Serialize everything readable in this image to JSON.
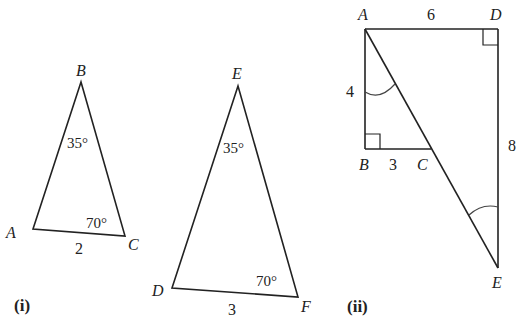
{
  "figures": [
    {
      "caption": "(i)",
      "triangles": [
        {
          "vertices": {
            "A": "A",
            "B": "B",
            "C": "C"
          },
          "angle_B": "35°",
          "angle_C": "70°",
          "side_AC": "2"
        },
        {
          "vertices": {
            "D": "D",
            "E": "E",
            "F": "F"
          },
          "angle_E": "35°",
          "angle_F": "70°",
          "side_DF": "3"
        }
      ]
    },
    {
      "caption": "(ii)",
      "vertices": {
        "A": "A",
        "B": "B",
        "C": "C",
        "D": "D",
        "E": "E"
      },
      "side_AD": "6",
      "side_AB": "4",
      "side_BC": "3",
      "side_DE": "8",
      "right_angles": [
        "B",
        "D"
      ],
      "marked_angles": [
        "BAC",
        "DEA"
      ]
    }
  ]
}
